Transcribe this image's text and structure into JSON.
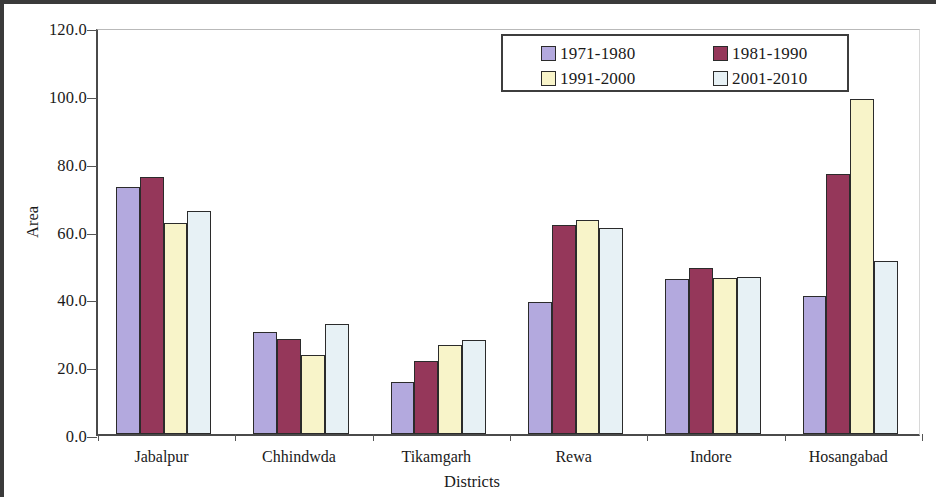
{
  "chart_data": {
    "type": "bar",
    "title": "",
    "xlabel": "Districts",
    "ylabel": "Area",
    "ylim": [
      0,
      120
    ],
    "ytick_step": 20,
    "ytick_labels": [
      "0.0",
      "20.0",
      "40.0",
      "60.0",
      "80.0",
      "100.0",
      "120.0"
    ],
    "grid": false,
    "legend_position": "top-right",
    "categories": [
      "Jabalpur",
      "Chhindwda",
      "Tikamgarh",
      "Rewa",
      "Indore",
      "Hosangabad"
    ],
    "series": [
      {
        "name": "1971-1980",
        "color": "#b3a9de",
        "values": [
          72.8,
          30.2,
          15.4,
          39.0,
          45.6,
          40.7
        ]
      },
      {
        "name": "1981-1990",
        "color": "#95375a",
        "values": [
          75.8,
          27.9,
          21.6,
          61.7,
          49.0,
          76.8
        ]
      },
      {
        "name": "1991-2000",
        "color": "#f8f4c9",
        "values": [
          62.3,
          23.4,
          26.1,
          63.2,
          46.1,
          98.8
        ]
      },
      {
        "name": "2001-2010",
        "color": "#e7f1f5",
        "values": [
          65.8,
          32.5,
          27.6,
          60.6,
          46.3,
          51.0
        ]
      }
    ]
  },
  "legend": {
    "entries": [
      "1971-1980",
      "1981-1990",
      "1991-2000",
      "2001-2010"
    ]
  },
  "axes": {
    "y_title": "Area",
    "x_title": "Districts"
  }
}
